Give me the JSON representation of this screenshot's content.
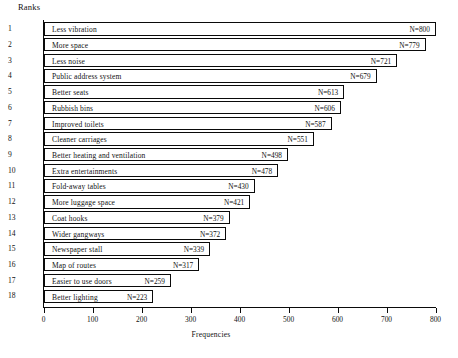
{
  "chart_data": {
    "type": "bar",
    "orientation": "horizontal",
    "title": "",
    "xlabel": "Frequencies",
    "ylabel": "Ranks",
    "xlim": [
      0,
      800
    ],
    "xticks": [
      0,
      100,
      200,
      300,
      400,
      500,
      600,
      700,
      800
    ],
    "grid": false,
    "legend": null,
    "value_label_prefix": "N=",
    "ranks": [
      1,
      2,
      3,
      4,
      5,
      6,
      7,
      8,
      9,
      10,
      11,
      12,
      13,
      14,
      15,
      16,
      17,
      18
    ],
    "categories": [
      "Less vibration",
      "More space",
      "Less noise",
      "Public address system",
      "Better seats",
      "Rubbish bins",
      "Improved toilets",
      "Cleaner carriages",
      "Better heating and ventilation",
      "Extra entertainments",
      "Fold-away tables",
      "More luggage space",
      "Coat hooks",
      "Wider gangways",
      "Newspaper stall",
      "Map of routes",
      "Easier to use doors",
      "Better lighting"
    ],
    "values": [
      800,
      779,
      721,
      679,
      613,
      606,
      587,
      551,
      498,
      478,
      430,
      421,
      379,
      372,
      339,
      317,
      259,
      223
    ],
    "value_labels": [
      "N=800",
      "N=779",
      "N=721",
      "N=679",
      "N=613",
      "N=606",
      "N=587",
      "N=551",
      "N=498",
      "N=478",
      "N=430",
      "N=421",
      "N=379",
      "N=372",
      "N=339",
      "N=317",
      "N=259",
      "N=223"
    ],
    "colors": {
      "bar_fill": "#ffffff",
      "bar_stroke": "#0a0a0a",
      "axis": "#0a0a0a",
      "text": "#111111"
    }
  },
  "axes": {
    "ranks_caption": "Ranks",
    "x_title": "Frequencies",
    "x_tick_labels": [
      "0",
      "100",
      "200",
      "300",
      "400",
      "500",
      "600",
      "700",
      "800"
    ]
  }
}
